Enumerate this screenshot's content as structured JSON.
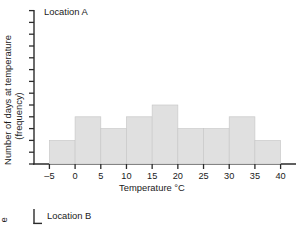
{
  "figure": {
    "panels": [
      {
        "title": "Location A",
        "y_axis_label_line1": "Number of days at temperature",
        "y_axis_label_line2": "(frequency)",
        "x_axis_label": "Temperature °C"
      },
      {
        "title": "Location B",
        "y_axis_label_fragment": "e"
      }
    ],
    "colors": {
      "bar_fill": "#e0e0e0",
      "bar_stroke": "#c9c9c9",
      "axis": "#2b2b2b",
      "text": "#1a1a1a",
      "background": "#ffffff"
    }
  },
  "chart_data": {
    "type": "bar",
    "title": "Location A",
    "xlabel": "Temperature °C",
    "ylabel": "Number of days at temperature (frequency)",
    "xlim": [
      -8,
      43
    ],
    "ylim": [
      0,
      13
    ],
    "grid": false,
    "legend": "none",
    "xticks": [
      -5,
      0,
      5,
      10,
      15,
      20,
      25,
      30,
      35,
      40
    ],
    "xticklabels": [
      "–5",
      "0",
      "5",
      "10",
      "15",
      "20",
      "25",
      "30",
      "35",
      "40"
    ],
    "yticks": [
      1,
      2,
      3,
      4,
      5,
      6,
      7,
      8,
      9,
      10,
      11,
      12,
      13
    ],
    "yticklabels": [
      "",
      "",
      "",
      "",
      "",
      "",
      "",
      "",
      "",
      "",
      "",
      "",
      ""
    ],
    "bin_edges": [
      -5,
      0,
      5,
      10,
      15,
      20,
      25,
      30,
      35,
      40
    ],
    "categories": [
      "-5 to 0",
      "0 to 5",
      "5 to 10",
      "10 to 15",
      "15 to 20",
      "20 to 25",
      "25 to 30",
      "30 to 35",
      "35 to 40"
    ],
    "values": [
      2,
      4,
      3,
      4,
      5,
      3,
      3,
      4,
      2
    ]
  }
}
